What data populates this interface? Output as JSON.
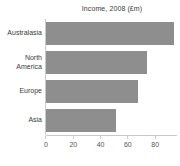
{
  "title": "Income, 2008 (£m)",
  "colors": {
    "bar": "#8e8e8e",
    "axis": "#c9c9c9",
    "label_text": "#3a3a3a",
    "tick_text": "#555555",
    "background": "#ffffff"
  },
  "chart_data": {
    "type": "bar",
    "orientation": "horizontal",
    "title": "Income, 2008 (£m)",
    "categories": [
      "Australasia",
      "North America",
      "Europe",
      "Asia"
    ],
    "values": [
      92,
      72,
      66,
      50
    ],
    "xlabel": "",
    "ylabel": "",
    "xlim": [
      0,
      96
    ],
    "xticks": [
      0,
      20,
      40,
      60,
      80
    ],
    "grid": false,
    "legend": null
  }
}
